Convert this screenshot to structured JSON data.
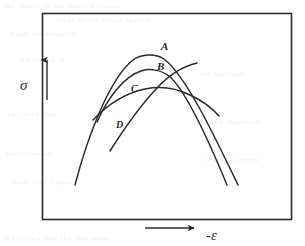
{
  "figure": {
    "background_color": "#ffffff",
    "ink_color": "#2b2b2b",
    "frame": {
      "name": "plot-frame",
      "x": 42,
      "y": 13,
      "width": 250,
      "height": 207,
      "stroke_width": 1.6
    },
    "axes": {
      "y_axis": {
        "label": "σ",
        "label_x": 22,
        "label_y": 86,
        "arrow": {
          "x": 47,
          "y_bottom": 100,
          "y_top": 58
        }
      },
      "x_axis": {
        "label": "-ε",
        "label_x": 214,
        "label_y": 238,
        "arrow": {
          "y": 228,
          "x_left": 145,
          "x_right": 196
        }
      }
    },
    "curves": [
      {
        "id": "A",
        "label": "A",
        "label_x": 161,
        "label_y": 50,
        "description": "widest outer parabola, highest peak",
        "peak": {
          "x": 148,
          "y": 53
        },
        "path": "M 75 185 C 88 135, 110 78, 133 60 C 141 54, 155 53, 164 59 C 186 76, 213 133, 238 185"
      },
      {
        "id": "B",
        "label": "B",
        "label_x": 157,
        "label_y": 70,
        "description": "second parabola, slightly lower and narrower peak, descends right",
        "peak": {
          "x": 152,
          "y": 70
        },
        "path": "M 97 122 C 108 97, 125 76, 141 71 C 150 68, 161 70, 169 76 C 186 90, 208 139, 227 185"
      },
      {
        "id": "C",
        "label": "C",
        "label_x": 131,
        "label_y": 92,
        "description": "broad low arc peaking right of center, shallow descent",
        "peak": {
          "x": 163,
          "y": 87
        },
        "path": "M 93 120 C 108 104, 126 93, 145 89 C 160 86, 176 88, 190 95 C 203 101, 212 108, 219 116"
      },
      {
        "id": "D",
        "label": "D",
        "label_x": 119,
        "label_y": 127,
        "description": "steeply rising line from lower left crossing the other curves",
        "start": {
          "x": 110,
          "y": 151
        },
        "path": "M 110 151 C 122 132, 140 106, 157 88 C 170 74, 184 66, 197 63"
      }
    ],
    "labels": {
      "curve_a": "A",
      "curve_b": "B",
      "curve_c": "C",
      "curve_d": "D",
      "sigma": "σ",
      "neg_epsilon": "-ε"
    },
    "background_bleed": [
      {
        "text": "the  result  of  the  applied  stress",
        "x": 4,
        "y": 2
      },
      {
        "text": "level  of  the  strain  region",
        "x": 56,
        "y": 16
      },
      {
        "text": "when  the  value  of",
        "x": 10,
        "y": 30
      },
      {
        "text": "are  shown  in",
        "x": 18,
        "y": 56
      },
      {
        "text": "for  the  case",
        "x": 200,
        "y": 70
      },
      {
        "text": "in  which  the",
        "x": 8,
        "y": 110
      },
      {
        "text": "and  therefore",
        "x": 210,
        "y": 118
      },
      {
        "text": "with  a  small",
        "x": 6,
        "y": 150
      },
      {
        "text": "that  the  curves",
        "x": 205,
        "y": 156
      },
      {
        "text": "from  this  figure",
        "x": 12,
        "y": 178
      },
      {
        "text": "it  follows  that  the  maximum",
        "x": 4,
        "y": 234
      }
    ]
  }
}
